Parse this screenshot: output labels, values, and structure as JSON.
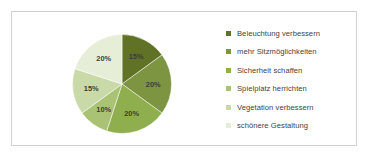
{
  "chart_data": {
    "type": "pie",
    "title": "",
    "legend_position": "right",
    "categories": [
      "Beleuchtung verbessern",
      "mehr Sitzmöglichkeiten",
      "Sicherheit schaffen",
      "Spielplatz herrichten",
      "Vegetation verbessern",
      "schönere Gestaltung"
    ],
    "values": [
      15,
      20,
      20,
      10,
      15,
      20
    ],
    "value_labels": [
      "15%",
      "20%",
      "20%",
      "10%",
      "15%",
      "20%"
    ],
    "colors": [
      "#5f7226",
      "#7d9440",
      "#8fae4e",
      "#a9c274",
      "#c9d9a8",
      "#e7eed8"
    ],
    "start_angle_deg": 0,
    "direction": "clockwise"
  },
  "legend": {
    "items": [
      {
        "label": "Beleuchtung verbessern",
        "color": "#5f7226"
      },
      {
        "label": "mehr Sitzmöglichkeiten",
        "color": "#7d9440"
      },
      {
        "label": "Sicherheit schaffen",
        "color": "#8fae4e"
      },
      {
        "label": "Spielplatz herrichten",
        "color": "#a9c274"
      },
      {
        "label": "Vegetation verbessern",
        "color": "#c9d9a8"
      },
      {
        "label": "schönere Gestaltung",
        "color": "#e7eed8"
      }
    ]
  },
  "frame": {
    "border_color": "#d2d2d2",
    "background": "#ffffff"
  }
}
